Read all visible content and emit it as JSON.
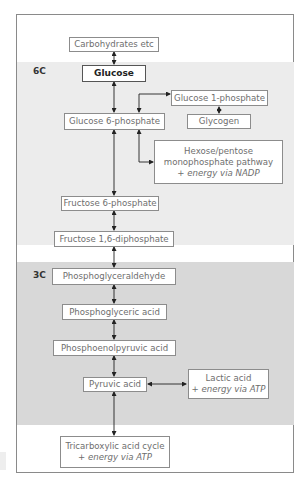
{
  "diagram": {
    "sections": [
      {
        "id": "6c",
        "label": "6C"
      },
      {
        "id": "3c",
        "label": "3C"
      }
    ],
    "nodes": {
      "carbohydrates": {
        "label": "Carbohydrates etc"
      },
      "glucose": {
        "label": "Glucose"
      },
      "glucose_1_phosphate": {
        "label": "Glucose 1-phosphate"
      },
      "glycogen": {
        "label": "Glycogen"
      },
      "glucose_6_phosphate": {
        "label": "Glucose 6-phosphate"
      },
      "hexose_pathway": {
        "line1": "Hexose/pentose",
        "line2": "monophosphate pathway",
        "line3": "+ energy via NADP"
      },
      "fructose_6_phosphate": {
        "label": "Fructose 6-phosphate"
      },
      "fructose_16_diphosphate": {
        "label": "Fructose 1,6-diphosphate"
      },
      "phosphoglyceraldehyde": {
        "label": "Phosphoglyceraldehyde"
      },
      "phosphoglyceric_acid": {
        "label": "Phosphoglyceric acid"
      },
      "phosphoenolpyruvic_acid": {
        "label": "Phosphoenolpyruvic acid"
      },
      "pyruvic_acid": {
        "label": "Pyruvic acid"
      },
      "lactic_acid": {
        "line1": "Lactic acid",
        "line2": "+ energy via ATP"
      },
      "tca_cycle": {
        "line1": "Tricarboxylic acid cycle",
        "line2": "+ energy via ATP"
      }
    },
    "edges": [
      {
        "from": "carbohydrates",
        "to": "glucose",
        "type": "bidirectional"
      },
      {
        "from": "glucose",
        "to": "glucose_6_phosphate",
        "type": "bidirectional"
      },
      {
        "from": "glucose_6_phosphate",
        "to": "glucose_1_phosphate",
        "type": "bidirectional"
      },
      {
        "from": "glucose_1_phosphate",
        "to": "glycogen",
        "type": "bidirectional"
      },
      {
        "from": "glucose_6_phosphate",
        "to": "hexose_pathway",
        "type": "bidirectional"
      },
      {
        "from": "glucose_6_phosphate",
        "to": "fructose_6_phosphate",
        "type": "bidirectional"
      },
      {
        "from": "fructose_6_phosphate",
        "to": "fructose_16_diphosphate",
        "type": "bidirectional"
      },
      {
        "from": "fructose_16_diphosphate",
        "to": "phosphoglyceraldehyde",
        "type": "bidirectional"
      },
      {
        "from": "phosphoglyceraldehyde",
        "to": "phosphoglyceric_acid",
        "type": "bidirectional"
      },
      {
        "from": "phosphoglyceric_acid",
        "to": "phosphoenolpyruvic_acid",
        "type": "bidirectional"
      },
      {
        "from": "phosphoenolpyruvic_acid",
        "to": "pyruvic_acid",
        "type": "bidirectional"
      },
      {
        "from": "pyruvic_acid",
        "to": "lactic_acid",
        "type": "bidirectional"
      },
      {
        "from": "pyruvic_acid",
        "to": "tca_cycle",
        "type": "bidirectional"
      }
    ]
  }
}
